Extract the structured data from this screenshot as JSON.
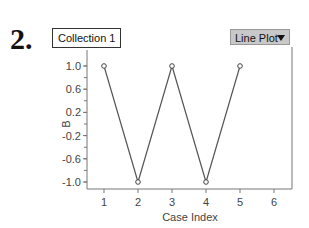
{
  "label_number": "2.",
  "collection_label": "Collection 1",
  "plot_type_dropdown": "Line Plot",
  "chart_data": {
    "type": "line",
    "title": "",
    "xlabel": "Case Index",
    "ylabel": "B",
    "x": [
      1,
      2,
      3,
      4,
      5
    ],
    "series": [
      {
        "name": "B",
        "values": [
          1.0,
          -1.0,
          1.0,
          -1.0,
          1.0
        ]
      }
    ],
    "xticks": [
      "1",
      "2",
      "3",
      "4",
      "5",
      "6"
    ],
    "yticks": [
      "1.0",
      "0.6",
      "0.2",
      "-0.2",
      "-0.6",
      "-1.0"
    ],
    "xlim": [
      0.5,
      6.5
    ],
    "ylim": [
      -1.1,
      1.1
    ],
    "grid": false,
    "legend": "none"
  }
}
